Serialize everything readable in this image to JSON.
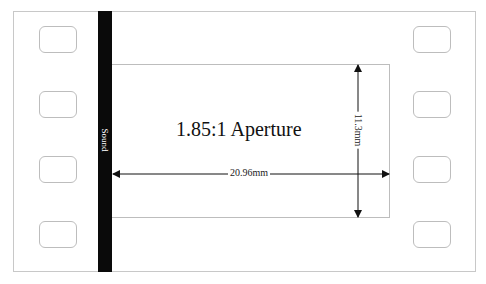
{
  "diagram": {
    "title": "1.85:1 Aperture",
    "sound_track_label": "Sound",
    "width_dimension": "20.96mm",
    "height_dimension": "11.3mm",
    "perforations": {
      "left_count": 4,
      "right_count": 4
    },
    "colors": {
      "sound_strip": "#0a0a0a",
      "outline": "#bdbdbd",
      "arrow": "#111111",
      "background": "#ffffff"
    }
  }
}
